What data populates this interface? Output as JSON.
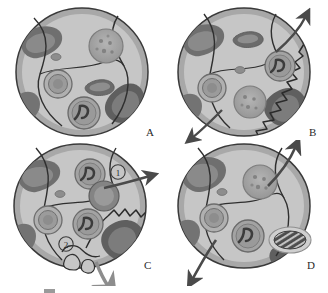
{
  "figure": {
    "kind": "scientific-illustration",
    "panel_count": 4,
    "colors": {
      "background": "#ffffff",
      "membrane_stroke": "#3a3a3a",
      "membrane_band": "#a8a8a8",
      "cytoplasm": "#d9d9d9",
      "inner_region": "#cacaca",
      "dark_patch": "#777777",
      "dark_patch_deep": "#5f5f5f",
      "organelle_mid": "#9e9e9e",
      "organelle_dark": "#6e6e6e",
      "arrow": "#4a4a4a",
      "label_text": "#2a2a2a",
      "caption_text": "#b9b9b9"
    }
  },
  "panels": [
    {
      "id": "A",
      "label": "A",
      "state": "intact cell",
      "has_rupture": false,
      "has_arrows": false,
      "markers": [],
      "organelles": [
        "stippled-granular-body",
        "concentric-ring-vesicle",
        "dark-crescent-body",
        "branched-inclusion-body",
        "small-oval-granule"
      ]
    },
    {
      "id": "B",
      "label": "B",
      "state": "membrane rupture with efflux",
      "has_rupture": true,
      "has_arrows": true,
      "arrow_count": 2,
      "markers": [],
      "organelles": [
        "stippled-granular-body",
        "concentric-ring-vesicle",
        "dark-crescent-body",
        "branched-inclusion-body",
        "small-oval-granule"
      ]
    },
    {
      "id": "C",
      "label": "C",
      "state": "fragmentation with budding",
      "has_rupture": true,
      "has_arrows": true,
      "arrow_count": 2,
      "markers": [
        "①",
        "②"
      ],
      "organelles": [
        "branched-inclusion-body",
        "fusing-vesicle-pair",
        "concentric-ring-vesicle",
        "small-oval-granule",
        "membrane-bleb-cluster"
      ]
    },
    {
      "id": "D",
      "label": "D",
      "state": "late stage with striated body",
      "has_rupture": false,
      "has_arrows": true,
      "arrow_count": 2,
      "markers": [],
      "organelles": [
        "stippled-granular-body",
        "concentric-ring-vesicle",
        "branched-inclusion-body",
        "striated-oval-body",
        "small-oval-granule"
      ]
    }
  ],
  "caption": {
    "swatch_present": true,
    "text": "",
    "clipped": true
  }
}
